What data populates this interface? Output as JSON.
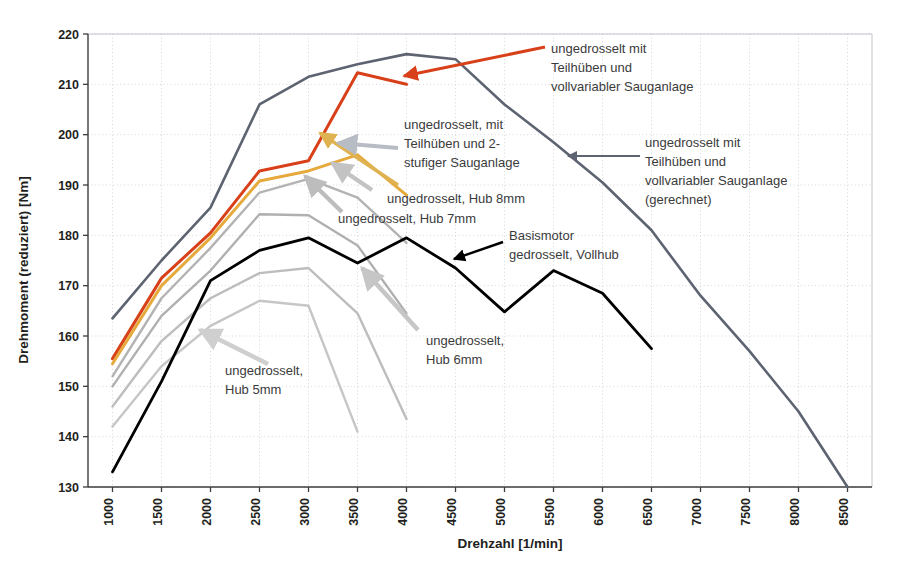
{
  "chart_data": {
    "type": "line",
    "title": "",
    "xlabel": "Drehzahl [1/min]",
    "ylabel": "Drehmoment (reduziert) [Nm]",
    "xlim": [
      750,
      8750
    ],
    "ylim": [
      130,
      220
    ],
    "xticks": [
      1000,
      1500,
      2000,
      2500,
      3000,
      3500,
      4000,
      4500,
      5000,
      5500,
      6000,
      6500,
      7000,
      7500,
      8000,
      8500
    ],
    "xtick_labels": [
      "1000",
      "1500",
      "2000",
      "2500",
      "3000",
      "3500",
      "4000",
      "4500",
      "5000",
      "5500",
      "6000",
      "6500",
      "7000",
      "7500",
      "8000",
      "8500"
    ],
    "yticks": [
      130,
      140,
      150,
      160,
      170,
      180,
      190,
      200,
      210,
      220
    ],
    "ytick_labels": [
      "130",
      "140",
      "150",
      "160",
      "170",
      "180",
      "190",
      "200",
      "210",
      "220"
    ],
    "grid": true,
    "legend": "annotations",
    "series": [
      {
        "name": "ungedrosselt mit Teilhüben und vollvariabler Sauganlage (gerechnet)",
        "color": "#5d6370",
        "width": 2.6,
        "x": [
          1000,
          1500,
          2000,
          2500,
          3000,
          3500,
          4000,
          4500,
          5000,
          5500,
          6000,
          6500,
          7000,
          7500,
          8000,
          8500
        ],
        "y": [
          163.5,
          175.0,
          185.5,
          206.0,
          211.5,
          214.0,
          216.0,
          215.0,
          206.0,
          198.5,
          190.5,
          181.0,
          168.0,
          157.0,
          145.0,
          130.0
        ]
      },
      {
        "name": "ungedrosselt mit Teilhüben und vollvariabler Sauganlage",
        "color": "#d8401a",
        "width": 3.0,
        "x": [
          1000,
          1500,
          2000,
          2500,
          3000,
          3500,
          4000
        ],
        "y": [
          155.5,
          171.5,
          180.5,
          192.8,
          194.8,
          212.3,
          210.0
        ]
      },
      {
        "name": "ungedrosselt, mit Teilhüben und 2-stufiger Sauganlage",
        "color": "#e6a93c",
        "width": 3.0,
        "x": [
          1000,
          1500,
          2000,
          2500,
          3000,
          3500,
          4000
        ],
        "y": [
          154.5,
          170.0,
          179.5,
          190.8,
          192.8,
          196.0,
          188.0
        ]
      },
      {
        "name": "ungedrosselt, Hub 8mm",
        "color": "#b3b3b3",
        "width": 2.4,
        "x": [
          1000,
          1500,
          2000,
          2500,
          3000,
          3500,
          4000
        ],
        "y": [
          152.0,
          167.5,
          177.5,
          188.5,
          191.2,
          187.5,
          178.5
        ]
      },
      {
        "name": "ungedrosselt, Hub 7mm",
        "color": "#b0b0b0",
        "width": 2.4,
        "x": [
          1000,
          1500,
          2000,
          2500,
          3000,
          3500,
          4000
        ],
        "y": [
          150.0,
          164.0,
          173.0,
          184.2,
          184.0,
          178.0,
          164.5
        ]
      },
      {
        "name": "ungedrosselt, Hub 6mm",
        "color": "#bdbdbd",
        "width": 2.4,
        "x": [
          1000,
          1500,
          2000,
          2500,
          3000,
          3500,
          4000
        ],
        "y": [
          146.0,
          159.0,
          167.5,
          172.5,
          173.5,
          164.5,
          143.5
        ]
      },
      {
        "name": "ungedrosselt, Hub 5mm",
        "color": "#c6c6c6",
        "width": 2.4,
        "x": [
          1000,
          1500,
          2000,
          2500,
          3000,
          3500
        ],
        "y": [
          142.0,
          154.0,
          162.0,
          167.0,
          166.0,
          141.0
        ]
      },
      {
        "name": "Basismotor gedrosselt, Vollhub",
        "color": "#000000",
        "width": 2.8,
        "x": [
          1000,
          1500,
          2000,
          2500,
          3000,
          3500,
          4000,
          4500,
          5000,
          5500,
          6000,
          6500
        ],
        "y": [
          133.0,
          151.0,
          171.0,
          177.0,
          179.5,
          174.5,
          179.5,
          173.5,
          164.8,
          173.0,
          168.5,
          157.5
        ]
      }
    ],
    "annotations": [
      {
        "id": "anno-ungedrosselt-vollvariabel",
        "lines": [
          "ungedrosselt mit",
          "Teilhüben und",
          "vollvariabler Sauganlage"
        ],
        "color": "#d8401a",
        "text_x": 551,
        "text_y": 53
      },
      {
        "id": "anno-2stufige-sauganlage",
        "lines": [
          "ungedrosselt, mit",
          "Teilhüben und 2-",
          "stufiger Sauganlage"
        ],
        "color": "#e6a93c",
        "text_x": 404,
        "text_y": 129
      },
      {
        "id": "anno-gerechnet",
        "lines": [
          "ungedrosselt mit",
          "Teilhüben und",
          "vollvariabler Sauganlage",
          "(gerechnet)"
        ],
        "color": "#5d6370",
        "text_x": 645,
        "text_y": 147
      },
      {
        "id": "anno-hub-8mm",
        "lines": [
          "ungedrosselt, Hub 8mm"
        ],
        "color": "#b3b3b3",
        "text_x": 387,
        "text_y": 203
      },
      {
        "id": "anno-hub-7mm",
        "lines": [
          "ungedrosselt, Hub 7mm"
        ],
        "color": "#b0b0b0",
        "text_x": 338,
        "text_y": 223
      },
      {
        "id": "anno-basismotor",
        "lines": [
          "Basismotor",
          "gedrosselt, Vollhub"
        ],
        "color": "#000000",
        "text_x": 509,
        "text_y": 240
      },
      {
        "id": "anno-hub-6mm",
        "lines": [
          "ungedrosselt,",
          "Hub 6mm"
        ],
        "color": "#bdbdbd",
        "text_x": 426,
        "text_y": 345
      },
      {
        "id": "anno-hub-5mm",
        "lines": [
          "ungedrosselt,",
          "Hub 5mm"
        ],
        "color": "#c6c6c6",
        "text_x": 225,
        "text_y": 375
      }
    ],
    "arrows": [
      {
        "id": "arrow-red",
        "color": "#d8401a",
        "x1": 545,
        "y1": 47,
        "x2": 404,
        "y2": 76,
        "w": 3.0
      },
      {
        "id": "arrow-orange",
        "color": "#e0b352",
        "x1": 398,
        "y1": 185,
        "x2": 320,
        "y2": 133,
        "w": 3.4
      },
      {
        "id": "arrow-gray-2stufig",
        "color": "#b8bcc4",
        "x1": 398,
        "y1": 148,
        "x2": 338,
        "y2": 143,
        "w": 4.2
      },
      {
        "id": "arrow-gerechnet",
        "color": "#5d6370",
        "x1": 640,
        "y1": 156,
        "x2": 568,
        "y2": 156,
        "w": 2.0
      },
      {
        "id": "arrow-black",
        "color": "#000000",
        "x1": 503,
        "y1": 242,
        "x2": 454,
        "y2": 259,
        "w": 2.4
      },
      {
        "id": "arrow-hub8",
        "color": "#c3c3c3",
        "x1": 372,
        "y1": 190,
        "x2": 332,
        "y2": 163,
        "w": 4.4
      },
      {
        "id": "arrow-hub7",
        "color": "#bdbdbd",
        "x1": 342,
        "y1": 212,
        "x2": 305,
        "y2": 176,
        "w": 4.4
      },
      {
        "id": "arrow-hub6",
        "color": "#c6c6c6",
        "x1": 418,
        "y1": 330,
        "x2": 362,
        "y2": 268,
        "w": 4.6
      },
      {
        "id": "arrow-hub5",
        "color": "#cfcfcf",
        "x1": 268,
        "y1": 364,
        "x2": 200,
        "y2": 330,
        "w": 4.6
      }
    ]
  },
  "axes": {
    "x_title": "Drehzahl [1/min]",
    "y_title": "Drehmoment (reduziert) [Nm]"
  }
}
